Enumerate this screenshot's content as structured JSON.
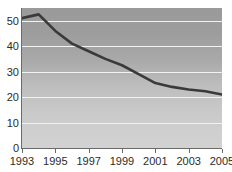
{
  "chart_data": {
    "type": "line",
    "title": "",
    "subtitle": "",
    "xlabel": "",
    "ylabel": "",
    "x": [
      1993,
      1994,
      1995,
      1996,
      1997,
      1998,
      1999,
      2000,
      2001,
      2002,
      2003,
      2004,
      2005
    ],
    "series": [
      {
        "name": "",
        "values": [
          51,
          52.5,
          46,
          41,
          38,
          35,
          32.5,
          29,
          25.5,
          24,
          23,
          22.3,
          21
        ]
      }
    ],
    "xlim": [
      1993,
      2005
    ],
    "ylim": [
      0,
      55
    ],
    "x_tick_labels": [
      "1993",
      "1995",
      "1997",
      "1999",
      "2001",
      "2003",
      "2005"
    ],
    "x_tick_values": [
      1993,
      1995,
      1997,
      1999,
      2001,
      2003,
      2005
    ],
    "y_tick_labels": [
      "0",
      "10",
      "20",
      "30",
      "40",
      "50"
    ],
    "y_tick_values": [
      0,
      10,
      20,
      30,
      40,
      50
    ],
    "grid": true,
    "grid_orientation": "horizontal",
    "legend": false,
    "legend_position": "none",
    "annotations": [],
    "colors": {
      "line": "#3a3a3a",
      "gridline": "#f2f2f2",
      "axis": "#6b6b6b",
      "plot_background_top": "#9a9a9a",
      "plot_background_bottom": "#d2d2d2",
      "page_background": "#ffffff",
      "tick_label": "#2b2b2b"
    }
  }
}
